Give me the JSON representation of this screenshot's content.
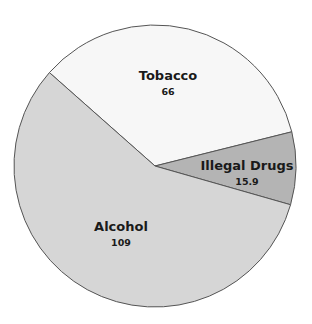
{
  "chart_data": {
    "type": "pie",
    "title": "",
    "categories": [
      "Tobacco",
      "Illegal Drugs",
      "Alcohol"
    ],
    "values": [
      66,
      15.9,
      109
    ],
    "value_labels": [
      "66",
      "15.9",
      "109"
    ],
    "colors": [
      "#f7f7f7",
      "#b4b4b4",
      "#d6d6d6"
    ],
    "start_angle_deg": 311.5,
    "direction": "clockwise",
    "legend": "none",
    "labels_inside": true
  },
  "labels": {
    "tobacco": {
      "name": "Tobacco",
      "value": "66"
    },
    "drugs": {
      "name": "Illegal Drugs",
      "value": "15.9"
    },
    "alcohol": {
      "name": "Alcohol",
      "value": "109"
    }
  }
}
